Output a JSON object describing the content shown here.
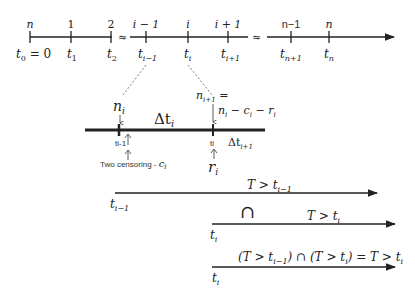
{
  "main_timeline": {
    "ticks": [
      {
        "top": "n",
        "bottom": "t",
        "sub": "0",
        "suffix": " = 0"
      },
      {
        "top": "1",
        "bottom": "t",
        "sub": "1",
        "suffix": ""
      },
      {
        "top": "2",
        "bottom": "t",
        "sub": "2",
        "suffix": ""
      },
      {
        "top": "i − 1",
        "bottom": "t",
        "sub": "i−1",
        "suffix": ""
      },
      {
        "top": "i",
        "bottom": "t",
        "sub": "i",
        "suffix": ""
      },
      {
        "top": "i + 1",
        "bottom": "t",
        "sub": "i+1",
        "suffix": ""
      },
      {
        "top": "n−1",
        "bottom": "t",
        "sub": "n+1",
        "suffix": ""
      },
      {
        "top": "n",
        "bottom": "t",
        "sub": "n",
        "suffix": ""
      }
    ],
    "break_symbol": "≈"
  },
  "detail": {
    "n_i": "n",
    "n_i_sub": "i",
    "delta_t_i": "Δt",
    "delta_t_i_sub": "i",
    "n_next_label": "n",
    "n_next_sub": "i+1",
    "n_next_eq": " =",
    "n_formula": "n",
    "n_formula_rest1": " − c",
    "n_formula_rest2": " − r",
    "sub_i": "i",
    "tick_left": "ti-1",
    "tick_right": "ti",
    "delta_t_next": "Δt",
    "delta_t_next_sub": "i+1",
    "censor_label": "Two censoring - ",
    "censor_c": "c",
    "r_label": "r"
  },
  "events": {
    "row1_label": "T > t",
    "row1_sub": "i−1",
    "row1_start": "t",
    "row1_start_sub": "i−1",
    "intersect": "∩",
    "row2_label": "T > t",
    "row2_sub": "i",
    "row2_start": "t",
    "row2_start_sub": "i",
    "row3_label_a": "(T > t",
    "row3_sub_a": "i−1",
    "row3_label_b": ") ∩ (T > t",
    "row3_sub_b": "i",
    "row3_label_c": ") = T > t",
    "row3_sub_c": "i",
    "row3_start": "t",
    "row3_start_sub": "i"
  }
}
